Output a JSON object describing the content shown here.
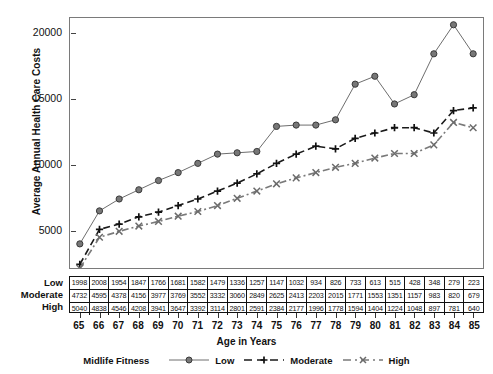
{
  "chart_data": {
    "type": "line",
    "title": "",
    "xlabel": "Age in Years",
    "ylabel": "Average Annual Health Care Costs",
    "x": [
      65,
      66,
      67,
      68,
      69,
      70,
      71,
      72,
      73,
      74,
      75,
      76,
      77,
      78,
      79,
      80,
      81,
      82,
      83,
      84,
      85
    ],
    "xlim": [
      64.5,
      85.5
    ],
    "ylim": [
      0,
      22000
    ],
    "yticks": [
      5000,
      10000,
      15000,
      20000
    ],
    "grid": false,
    "legend_title": "Midlife Fitness",
    "legend_position": "bottom",
    "series": [
      {
        "name": "Low",
        "marker": "circle",
        "line": "solid",
        "color": "#6e6e6e",
        "values": [
          4100,
          6600,
          7500,
          8200,
          8900,
          9500,
          10200,
          10900,
          11000,
          11100,
          13000,
          13100,
          13100,
          13500,
          16200,
          16800,
          14700,
          15400,
          18500,
          20700,
          18500
        ]
      },
      {
        "name": "Moderate",
        "marker": "plus",
        "line": "dashed",
        "color": "#1a1a1a",
        "values": [
          2550,
          5200,
          5600,
          6150,
          6500,
          7000,
          7500,
          8100,
          8700,
          9400,
          10200,
          10900,
          11500,
          11300,
          12100,
          12500,
          12900,
          12900,
          12500,
          14200,
          14400
        ]
      },
      {
        "name": "High",
        "marker": "x",
        "line": "dashdot",
        "color": "#7a7a7a",
        "values": [
          2250,
          4600,
          5050,
          5450,
          5800,
          6200,
          6550,
          7000,
          7550,
          8100,
          8650,
          9100,
          9500,
          9900,
          10200,
          10600,
          10950,
          10950,
          11600,
          13300,
          12900
        ]
      }
    ]
  },
  "axis": {
    "y_title": "Average Annual Health Care Costs",
    "x_title": "Age in Years",
    "y_ticks": [
      "20000",
      "15000",
      "10000",
      "5000"
    ],
    "x_ticks": [
      "65",
      "66",
      "67",
      "68",
      "69",
      "70",
      "71",
      "72",
      "73",
      "74",
      "75",
      "76",
      "77",
      "78",
      "79",
      "80",
      "81",
      "82",
      "83",
      "84",
      "85"
    ]
  },
  "table": {
    "rows": [
      {
        "label": "Low",
        "values": [
          "1998",
          "2008",
          "1954",
          "1847",
          "1766",
          "1681",
          "1582",
          "1479",
          "1336",
          "1257",
          "1147",
          "1032",
          "934",
          "826",
          "733",
          "613",
          "515",
          "428",
          "348",
          "279",
          "223"
        ]
      },
      {
        "label": "Moderate",
        "values": [
          "4732",
          "4595",
          "4378",
          "4156",
          "3977",
          "3769",
          "3552",
          "3332",
          "3060",
          "2849",
          "2625",
          "2413",
          "2203",
          "2015",
          "1771",
          "1553",
          "1351",
          "1157",
          "983",
          "820",
          "679"
        ]
      },
      {
        "label": "High",
        "values": [
          "5040",
          "4838",
          "4546",
          "4208",
          "3941",
          "3647",
          "3392",
          "3114",
          "2801",
          "2591",
          "2384",
          "2177",
          "1996",
          "1778",
          "1594",
          "1404",
          "1224",
          "1048",
          "897",
          "781",
          "640"
        ]
      }
    ]
  },
  "legend": {
    "title": "Midlife Fitness",
    "items": [
      {
        "label": "Low",
        "marker": "circle-marker",
        "color": "#6e6e6e"
      },
      {
        "label": "Moderate",
        "marker": "plus-marker",
        "color": "#1a1a1a"
      },
      {
        "label": "High",
        "marker": "x-marker",
        "color": "#7a7a7a"
      }
    ]
  }
}
